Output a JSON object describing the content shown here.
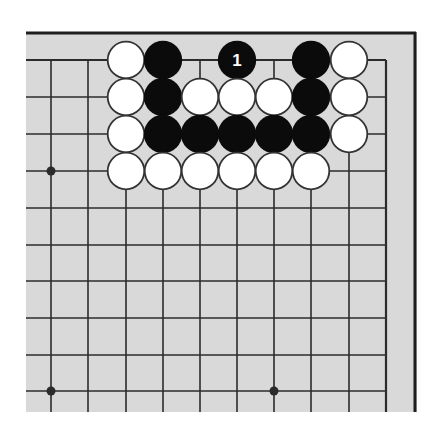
{
  "diagram": {
    "type": "go-board-fragment",
    "view": "top-right-corner",
    "colors": {
      "page_background": "#ffffff",
      "board_background": "#d9d9d9",
      "grid_line": "#2b2b2b",
      "frame_line": "#1e1e1e",
      "black_stone": "#0b0b0b",
      "white_stone_fill": "#ffffff",
      "white_stone_outline": "#333333",
      "label_on_black": "#ffffff"
    },
    "board_area": {
      "x": 26,
      "y": 32,
      "width": 391,
      "height": 380
    },
    "frame": {
      "top": {
        "x1": 26,
        "y1": 33,
        "x2": 416,
        "y2": 33,
        "width": 3
      },
      "right": {
        "x1": 415,
        "y1": 32,
        "x2": 415,
        "y2": 412,
        "width": 3
      }
    },
    "grid": {
      "columns_x": [
        51,
        88,
        126,
        163,
        200,
        237,
        274,
        311,
        349,
        386
      ],
      "rows_y": [
        60,
        97,
        134,
        171,
        208,
        245,
        281,
        318,
        355,
        391
      ],
      "h_line_from_x": 26,
      "h_line_to_x": 386,
      "v_line_from_y": 60,
      "v_line_to_y": 412,
      "line_width": 1.6,
      "edge_line_width": 2.2
    },
    "star_points": [
      {
        "col": 0,
        "row": 3
      },
      {
        "col": 0,
        "row": 9
      },
      {
        "col": 6,
        "row": 9
      }
    ],
    "star_radius": 4.5,
    "stone_radius": 18.6,
    "stones": [
      {
        "color": "white",
        "col": 2,
        "row": 0
      },
      {
        "color": "black",
        "col": 3,
        "row": 0
      },
      {
        "color": "black",
        "col": 5,
        "row": 0,
        "label": "1"
      },
      {
        "color": "black",
        "col": 7,
        "row": 0
      },
      {
        "color": "white",
        "col": 8,
        "row": 0
      },
      {
        "color": "white",
        "col": 2,
        "row": 1
      },
      {
        "color": "black",
        "col": 3,
        "row": 1
      },
      {
        "color": "white",
        "col": 4,
        "row": 1
      },
      {
        "color": "white",
        "col": 5,
        "row": 1
      },
      {
        "color": "white",
        "col": 6,
        "row": 1
      },
      {
        "color": "black",
        "col": 7,
        "row": 1
      },
      {
        "color": "white",
        "col": 8,
        "row": 1
      },
      {
        "color": "white",
        "col": 2,
        "row": 2
      },
      {
        "color": "black",
        "col": 3,
        "row": 2
      },
      {
        "color": "black",
        "col": 4,
        "row": 2
      },
      {
        "color": "black",
        "col": 5,
        "row": 2
      },
      {
        "color": "black",
        "col": 6,
        "row": 2
      },
      {
        "color": "black",
        "col": 7,
        "row": 2
      },
      {
        "color": "white",
        "col": 8,
        "row": 2
      },
      {
        "color": "white",
        "col": 2,
        "row": 3
      },
      {
        "color": "white",
        "col": 3,
        "row": 3
      },
      {
        "color": "white",
        "col": 4,
        "row": 3
      },
      {
        "color": "white",
        "col": 5,
        "row": 3
      },
      {
        "color": "white",
        "col": 6,
        "row": 3
      },
      {
        "color": "white",
        "col": 7,
        "row": 3
      }
    ],
    "move_labels": [
      "1"
    ]
  }
}
